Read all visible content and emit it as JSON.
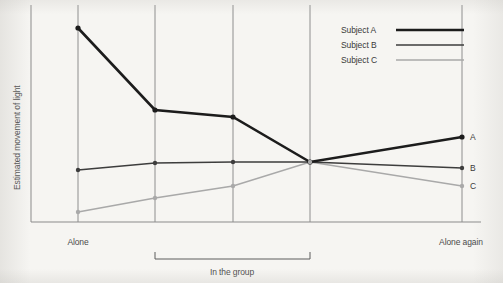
{
  "chart_data": {
    "type": "line",
    "title": "",
    "subtitle": "",
    "xlabel": "",
    "ylabel": "Estimated movement of light",
    "grid": "vertical gridlines at each session",
    "legend_position": "top-right inside plot",
    "axis_note": "y-axis unlabeled (no numeric ticks); x-axis shows session groupings",
    "categories": [
      "Alone",
      "Group 1",
      "Group 2",
      "Group 3",
      "Alone again"
    ],
    "x": [
      78,
      155,
      233,
      310,
      462
    ],
    "xlim": [
      31,
      480
    ],
    "ylim": [
      222,
      5
    ],
    "tick_labels": [
      "Alone",
      "Alone again"
    ],
    "group_bracket_label": "In the group",
    "group_bracket_span": [
      "Group 1",
      "Group 3"
    ],
    "series": [
      {
        "name": "Subject A",
        "end_label": "A",
        "color": "#1c1c1c",
        "width": 2.6,
        "values": [
          28,
          110,
          117,
          162,
          137
        ],
        "normalized_values": [
          0.89,
          0.52,
          0.48,
          0.28,
          0.39
        ]
      },
      {
        "name": "Subject B",
        "end_label": "B",
        "color": "#3d3d3d",
        "width": 1.7,
        "values": [
          170,
          163,
          162,
          162,
          168
        ],
        "normalized_values": [
          0.24,
          0.27,
          0.28,
          0.28,
          0.25
        ]
      },
      {
        "name": "Subject C",
        "end_label": "C",
        "color": "#a9a9a9",
        "width": 1.7,
        "values": [
          212,
          198,
          186,
          162,
          186
        ],
        "normalized_values": [
          0.05,
          0.11,
          0.17,
          0.28,
          0.17
        ]
      }
    ]
  },
  "legend": {
    "entries": [
      {
        "label": "Subject A",
        "swatch": "legend-swatch-a"
      },
      {
        "label": "Subject B",
        "swatch": "legend-swatch-b"
      },
      {
        "label": "Subject C",
        "swatch": "legend-swatch-c"
      }
    ]
  },
  "axes": {
    "y_title": "Estimated movement of light",
    "x_tick_left": "Alone",
    "x_tick_right": "Alone again",
    "group_label": "In the group"
  },
  "series_end_labels": {
    "a": "A",
    "b": "B",
    "c": "C"
  },
  "colors": {
    "subject_a": "#1c1c1c",
    "subject_b": "#3d3d3d",
    "subject_c": "#a9a9a9",
    "axis": "#8b8b8b",
    "text": "#4a4a4a",
    "background": "#f6f5f2"
  }
}
